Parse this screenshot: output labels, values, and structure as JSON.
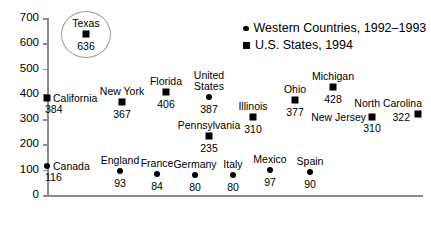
{
  "chart_data": {
    "type": "scatter",
    "title": "",
    "xlabel": "",
    "ylabel": "",
    "ylim": [
      0,
      700
    ],
    "yticks": [
      "0",
      "100",
      "200",
      "300",
      "400",
      "500",
      "600",
      "700"
    ],
    "grid": false,
    "legend_position": "top-right",
    "series": [
      {
        "name": "Western Countries, 1992–1993",
        "marker": "circle"
      },
      {
        "name": "U.S. States, 1994",
        "marker": "square"
      }
    ],
    "points": [
      {
        "label": "Texas",
        "value": 636,
        "marker": "square",
        "series": "U.S. States, 1994",
        "x": 86,
        "label_pos": "above",
        "highlighted": true
      },
      {
        "label": "California",
        "value": 384,
        "marker": "square",
        "series": "U.S. States, 1994",
        "x": 47,
        "label_pos": "right"
      },
      {
        "label": "New York",
        "value": 367,
        "marker": "square",
        "series": "U.S. States, 1994",
        "x": 122,
        "label_pos": "above"
      },
      {
        "label": "Florida",
        "value": 406,
        "marker": "square",
        "series": "U.S. States, 1994",
        "x": 166,
        "label_pos": "above"
      },
      {
        "label": "United States",
        "value": 387,
        "marker": "circle",
        "series": "Western Countries, 1992–1993",
        "x": 209,
        "label_pos": "above-wrap"
      },
      {
        "label": "Pennsylvania",
        "value": 235,
        "marker": "square",
        "series": "U.S. States, 1994",
        "x": 209,
        "label_pos": "above"
      },
      {
        "label": "Illinois",
        "value": 310,
        "marker": "square",
        "series": "U.S. States, 1994",
        "x": 253,
        "label_pos": "above"
      },
      {
        "label": "Ohio",
        "value": 377,
        "marker": "square",
        "series": "U.S. States, 1994",
        "x": 295,
        "label_pos": "above"
      },
      {
        "label": "Michigan",
        "value": 428,
        "marker": "square",
        "series": "U.S. States, 1994",
        "x": 333,
        "label_pos": "above"
      },
      {
        "label": "North Carolina",
        "value": 322,
        "marker": "square",
        "series": "U.S. States, 1994",
        "x": 418,
        "label_pos": "left-above"
      },
      {
        "label": "New Jersey",
        "value": 310,
        "marker": "square",
        "series": "U.S. States, 1994",
        "x": 372,
        "label_pos": "left"
      },
      {
        "label": "Canada",
        "value": 116,
        "marker": "circle",
        "series": "Western Countries, 1992–1993",
        "x": 47,
        "label_pos": "right"
      },
      {
        "label": "England",
        "value": 93,
        "marker": "circle",
        "series": "Western Countries, 1992–1993",
        "x": 120,
        "label_pos": "above"
      },
      {
        "label": "France",
        "value": 84,
        "marker": "circle",
        "series": "Western Countries, 1992–1993",
        "x": 157,
        "label_pos": "above"
      },
      {
        "label": "Germany",
        "value": 80,
        "marker": "circle",
        "series": "Western Countries, 1992–1993",
        "x": 195,
        "label_pos": "above"
      },
      {
        "label": "Italy",
        "value": 80,
        "marker": "circle",
        "series": "Western Countries, 1992–1993",
        "x": 233,
        "label_pos": "above"
      },
      {
        "label": "Mexico",
        "value": 97,
        "marker": "circle",
        "series": "Western Countries, 1992–1993",
        "x": 270,
        "label_pos": "above"
      },
      {
        "label": "Spain",
        "value": 90,
        "marker": "circle",
        "series": "Western Countries, 1992–1993",
        "x": 310,
        "label_pos": "above"
      }
    ]
  },
  "legend": {
    "items": [
      {
        "label": "Western Countries, 1992–1993",
        "marker": "circle"
      },
      {
        "label": "U.S. States, 1994",
        "marker": "square"
      }
    ]
  },
  "axis": {
    "y_ticks": [
      "700",
      "600",
      "500",
      "400",
      "300",
      "200",
      "100",
      "0"
    ]
  }
}
